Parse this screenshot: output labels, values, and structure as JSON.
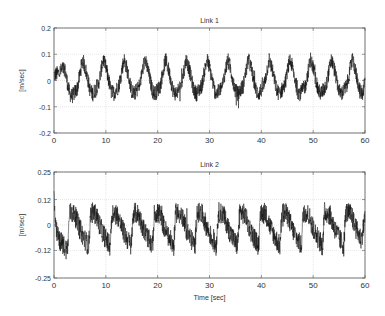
{
  "chart_data": [
    {
      "type": "line",
      "title": "Link 1",
      "xlabel": "",
      "ylabel": "[m/sec]",
      "xlim": [
        0,
        60
      ],
      "ylim": [
        -0.2,
        0.2
      ],
      "xticks": [
        0,
        10,
        20,
        30,
        40,
        50,
        60
      ],
      "xtick_labels": [
        "0",
        "10",
        "20",
        "30",
        "40",
        "50",
        "60"
      ],
      "yticks": [
        0.2,
        0.1,
        0,
        -0.1,
        -0.2
      ],
      "ytick_labels": [
        "0.2",
        "0.1",
        "0",
        "-0.1",
        "-0.2"
      ],
      "grid": true,
      "series": [
        {
          "name": "velocity",
          "description": "Noisy periodic sawtooth-like signal, period ~4.1 s, range approx -0.09 to 0.09",
          "x": [
            0,
            1,
            2,
            3,
            3.5,
            4.5,
            5.5,
            6,
            7,
            7.5,
            8.5,
            9.5,
            10,
            11,
            11.5,
            12.5,
            13.5,
            14,
            15,
            15.5,
            16.5,
            17.5,
            18,
            19,
            19.5,
            20.5,
            21.5,
            22,
            23,
            23.5,
            24.5,
            25.5,
            26,
            27,
            27.5,
            28.5,
            29.5,
            30,
            31,
            31.5,
            32.5,
            33.5,
            34,
            35,
            35.5,
            36.5,
            37.5,
            38,
            39,
            39.5,
            40.5,
            41.5,
            42,
            43,
            43.5,
            44.5,
            45.5,
            46,
            47,
            47.5,
            48.5,
            49.5,
            50,
            51,
            51.5,
            52.5,
            53.5,
            54,
            55,
            55.5,
            56.5,
            57.5,
            58,
            59,
            59.5,
            60
          ],
          "values": [
            0.02,
            0.03,
            0.05,
            -0.05,
            -0.06,
            -0.03,
            0.08,
            0.05,
            -0.04,
            -0.05,
            -0.02,
            0.08,
            0.05,
            -0.04,
            -0.05,
            -0.02,
            0.08,
            0.05,
            -0.04,
            -0.05,
            -0.02,
            0.08,
            0.05,
            -0.04,
            -0.05,
            -0.02,
            0.08,
            0.05,
            -0.04,
            -0.05,
            -0.02,
            0.08,
            0.05,
            -0.04,
            -0.05,
            -0.02,
            0.08,
            0.05,
            -0.04,
            -0.05,
            -0.02,
            0.08,
            0.05,
            -0.04,
            -0.05,
            -0.02,
            0.08,
            0.05,
            -0.04,
            -0.05,
            -0.02,
            0.08,
            0.05,
            -0.04,
            -0.05,
            -0.02,
            0.08,
            0.05,
            -0.04,
            -0.05,
            -0.02,
            0.08,
            0.05,
            -0.04,
            -0.05,
            -0.02,
            0.08,
            0.05,
            -0.04,
            -0.05,
            -0.02,
            0.08,
            0.05,
            -0.04,
            -0.05,
            0.0
          ],
          "noise_amplitude": 0.03,
          "color": "#111111"
        }
      ]
    },
    {
      "type": "line",
      "title": "Link 2",
      "xlabel": "Time [sec]",
      "ylabel": "[m/sec]",
      "xlim": [
        0,
        60
      ],
      "ylim": [
        -0.25,
        0.25
      ],
      "xticks": [
        0,
        10,
        20,
        30,
        40,
        50,
        60
      ],
      "xtick_labels": [
        "0",
        "10",
        "20",
        "30",
        "40",
        "50",
        "60"
      ],
      "yticks": [
        0.25,
        0.12,
        0,
        -0.12,
        -0.25
      ],
      "ytick_labels": [
        "0.25",
        "0.12",
        "0",
        "-0.12",
        "-0.25"
      ],
      "grid": true,
      "series": [
        {
          "name": "velocity",
          "description": "Noisy periodic signal, period ~4.1 s, jumps up to ~0.1 then ramps down to ~-0.12",
          "x": [
            0,
            0.3,
            1,
            2,
            2.6,
            3,
            4,
            5,
            6,
            6.7,
            7.1,
            8.1,
            9.1,
            10.1,
            10.8,
            11.2,
            12.2,
            13.2,
            14.2,
            14.9,
            15.3,
            16.3,
            17.3,
            18.3,
            19,
            19.4,
            20.4,
            21.4,
            22.4,
            23.1,
            23.5,
            24.5,
            25.5,
            26.5,
            27.2,
            27.6,
            28.6,
            29.6,
            30.6,
            31.3,
            31.7,
            32.7,
            33.7,
            34.7,
            35.4,
            35.8,
            36.8,
            37.8,
            38.8,
            39.5,
            39.9,
            40.9,
            41.9,
            42.9,
            43.6,
            44,
            45,
            46,
            47,
            47.7,
            48.1,
            49.1,
            50.1,
            51.1,
            51.8,
            52.2,
            53.2,
            54.2,
            55.2,
            55.9,
            56.3,
            57.3,
            58.3,
            59.3,
            60
          ],
          "values": [
            0.15,
            -0.02,
            -0.07,
            -0.1,
            -0.12,
            0.06,
            0.05,
            -0.02,
            -0.07,
            -0.1,
            0.06,
            0.05,
            -0.02,
            -0.07,
            -0.1,
            0.06,
            0.05,
            -0.02,
            -0.07,
            -0.1,
            0.06,
            0.05,
            -0.02,
            -0.07,
            -0.1,
            0.06,
            0.05,
            -0.02,
            -0.07,
            -0.1,
            0.06,
            0.05,
            -0.02,
            -0.07,
            -0.1,
            0.06,
            0.05,
            -0.02,
            -0.07,
            -0.1,
            0.06,
            0.05,
            -0.02,
            -0.07,
            -0.1,
            0.06,
            0.05,
            -0.02,
            -0.07,
            -0.1,
            0.06,
            0.05,
            -0.02,
            -0.07,
            -0.1,
            0.06,
            0.05,
            -0.02,
            -0.07,
            -0.1,
            0.06,
            0.05,
            -0.02,
            -0.07,
            -0.1,
            0.06,
            0.05,
            -0.02,
            -0.07,
            -0.1,
            0.06,
            0.05,
            -0.02,
            -0.07,
            0.04
          ],
          "noise_amplitude": 0.05,
          "color": "#111111"
        }
      ]
    }
  ],
  "layout": {
    "axes": [
      {
        "left": 54,
        "right": 365,
        "top": 28,
        "bottom": 133
      },
      {
        "left": 54,
        "right": 365,
        "top": 172,
        "bottom": 278
      }
    ],
    "frame_color": "#555555",
    "grid_color": "#d9d9d9",
    "text_color": "#333333"
  }
}
